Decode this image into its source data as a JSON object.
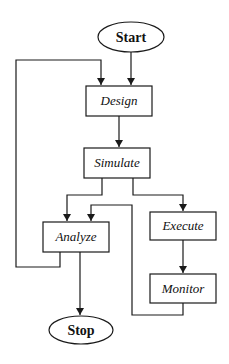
{
  "diagram": {
    "type": "flowchart",
    "colors": {
      "stroke": "#1a1a1a",
      "text": "#111111",
      "background": "#ffffff"
    },
    "nodes": {
      "start": {
        "label": "Start",
        "shape": "ellipse"
      },
      "design": {
        "label": "Design",
        "shape": "rectangle"
      },
      "simulate": {
        "label": "Simulate",
        "shape": "rectangle"
      },
      "analyze": {
        "label": "Analyze",
        "shape": "rectangle"
      },
      "execute": {
        "label": "Execute",
        "shape": "rectangle"
      },
      "monitor": {
        "label": "Monitor",
        "shape": "rectangle"
      },
      "stop": {
        "label": "Stop",
        "shape": "ellipse"
      }
    },
    "edges": [
      {
        "from": "Start",
        "to": "Design"
      },
      {
        "from": "Design",
        "to": "Simulate"
      },
      {
        "from": "Simulate",
        "to": "Analyze"
      },
      {
        "from": "Simulate",
        "to": "Execute"
      },
      {
        "from": "Execute",
        "to": "Monitor"
      },
      {
        "from": "Monitor",
        "to": "Analyze"
      },
      {
        "from": "Analyze",
        "to": "Design"
      },
      {
        "from": "Analyze",
        "to": "Stop"
      }
    ]
  }
}
